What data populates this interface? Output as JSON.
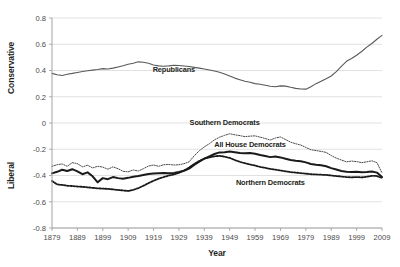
{
  "chart_data": {
    "type": "line",
    "title": "",
    "xlabel": "Year",
    "ylabel_top": "Conservative",
    "ylabel_bottom": "Liberal",
    "xlim": [
      1879,
      2009
    ],
    "ylim": [
      -0.8,
      0.8
    ],
    "ytick_labels": [
      "0.8",
      "0.6",
      "0.4",
      "0.2",
      "0",
      "-0.2",
      "-0.4",
      "-0.6",
      "-0.8"
    ],
    "ytick_values": [
      0.8,
      0.6,
      0.4,
      0.2,
      0,
      -0.2,
      -0.4,
      -0.6,
      -0.8
    ],
    "xtick_labels": [
      "1879",
      "1889",
      "1899",
      "1909",
      "1919",
      "1929",
      "1939",
      "1949",
      "1959",
      "1969",
      "1979",
      "1989",
      "1999",
      "2009"
    ],
    "xtick_values": [
      1879,
      1889,
      1899,
      1909,
      1919,
      1929,
      1939,
      1949,
      1959,
      1969,
      1979,
      1989,
      1999,
      2009
    ],
    "grid": true,
    "legend_position": "inline-annotations",
    "x": [
      1879,
      1881,
      1883,
      1885,
      1887,
      1889,
      1891,
      1893,
      1895,
      1897,
      1899,
      1901,
      1903,
      1905,
      1907,
      1909,
      1911,
      1913,
      1915,
      1917,
      1919,
      1921,
      1923,
      1925,
      1927,
      1929,
      1931,
      1933,
      1935,
      1937,
      1939,
      1941,
      1943,
      1945,
      1947,
      1949,
      1951,
      1953,
      1955,
      1957,
      1959,
      1961,
      1963,
      1965,
      1967,
      1969,
      1971,
      1973,
      1975,
      1977,
      1979,
      1981,
      1983,
      1985,
      1987,
      1989,
      1991,
      1993,
      1995,
      1997,
      1999,
      2001,
      2003,
      2005,
      2007,
      2009
    ],
    "series": [
      {
        "name": "Republicans",
        "style": "solid-thin",
        "color": "#595959",
        "width": 1.1,
        "values": [
          0.378,
          0.368,
          0.362,
          0.372,
          0.378,
          0.385,
          0.392,
          0.398,
          0.403,
          0.408,
          0.414,
          0.412,
          0.418,
          0.427,
          0.436,
          0.447,
          0.455,
          0.466,
          0.463,
          0.455,
          0.442,
          0.435,
          0.432,
          0.435,
          0.44,
          0.438,
          0.434,
          0.43,
          0.424,
          0.418,
          0.412,
          0.404,
          0.396,
          0.386,
          0.374,
          0.358,
          0.342,
          0.33,
          0.318,
          0.31,
          0.3,
          0.295,
          0.288,
          0.28,
          0.276,
          0.283,
          0.281,
          0.272,
          0.264,
          0.259,
          0.258,
          0.276,
          0.3,
          0.318,
          0.338,
          0.358,
          0.392,
          0.432,
          0.47,
          0.492,
          0.516,
          0.545,
          0.578,
          0.606,
          0.638,
          0.668
        ],
        "label_x": 1925,
        "label_text": "Republicans"
      },
      {
        "name": "Southern Democrats",
        "style": "dotted-thin",
        "color": "#4a4a4a",
        "width": 1.0,
        "values": [
          -0.33,
          -0.318,
          -0.312,
          -0.33,
          -0.302,
          -0.31,
          -0.334,
          -0.322,
          -0.342,
          -0.33,
          -0.336,
          -0.352,
          -0.334,
          -0.348,
          -0.368,
          -0.372,
          -0.358,
          -0.366,
          -0.348,
          -0.328,
          -0.32,
          -0.33,
          -0.318,
          -0.316,
          -0.32,
          -0.318,
          -0.31,
          -0.296,
          -0.25,
          -0.212,
          -0.182,
          -0.158,
          -0.128,
          -0.108,
          -0.094,
          -0.082,
          -0.09,
          -0.096,
          -0.104,
          -0.1,
          -0.098,
          -0.108,
          -0.118,
          -0.13,
          -0.114,
          -0.106,
          -0.126,
          -0.146,
          -0.158,
          -0.168,
          -0.186,
          -0.204,
          -0.21,
          -0.216,
          -0.224,
          -0.248,
          -0.268,
          -0.282,
          -0.296,
          -0.29,
          -0.294,
          -0.302,
          -0.296,
          -0.288,
          -0.302,
          -0.38
        ],
        "label_x": 1945,
        "label_text": "Southern Democrats"
      },
      {
        "name": "All House Democrats",
        "style": "solid-thick",
        "color": "#1a1a1a",
        "width": 2.0,
        "values": [
          -0.384,
          -0.372,
          -0.356,
          -0.366,
          -0.352,
          -0.368,
          -0.39,
          -0.376,
          -0.406,
          -0.452,
          -0.42,
          -0.428,
          -0.412,
          -0.42,
          -0.424,
          -0.418,
          -0.41,
          -0.404,
          -0.396,
          -0.388,
          -0.384,
          -0.382,
          -0.38,
          -0.382,
          -0.38,
          -0.374,
          -0.364,
          -0.348,
          -0.32,
          -0.294,
          -0.272,
          -0.254,
          -0.236,
          -0.224,
          -0.222,
          -0.218,
          -0.222,
          -0.228,
          -0.23,
          -0.228,
          -0.234,
          -0.244,
          -0.252,
          -0.26,
          -0.256,
          -0.262,
          -0.272,
          -0.282,
          -0.288,
          -0.292,
          -0.3,
          -0.312,
          -0.318,
          -0.322,
          -0.33,
          -0.344,
          -0.354,
          -0.366,
          -0.372,
          -0.374,
          -0.372,
          -0.376,
          -0.374,
          -0.37,
          -0.378,
          -0.412
        ],
        "label_x": 1955,
        "label_text": "All House Democrats"
      },
      {
        "name": "Northern Democrats",
        "style": "dotted-thick",
        "color": "#1a1a1a",
        "width": 1.8,
        "values": [
          -0.442,
          -0.468,
          -0.472,
          -0.478,
          -0.48,
          -0.484,
          -0.486,
          -0.49,
          -0.494,
          -0.498,
          -0.5,
          -0.502,
          -0.506,
          -0.51,
          -0.514,
          -0.518,
          -0.51,
          -0.496,
          -0.478,
          -0.458,
          -0.44,
          -0.424,
          -0.412,
          -0.4,
          -0.392,
          -0.38,
          -0.362,
          -0.34,
          -0.312,
          -0.29,
          -0.272,
          -0.262,
          -0.254,
          -0.25,
          -0.256,
          -0.266,
          -0.282,
          -0.296,
          -0.306,
          -0.316,
          -0.324,
          -0.334,
          -0.342,
          -0.35,
          -0.356,
          -0.362,
          -0.368,
          -0.374,
          -0.378,
          -0.382,
          -0.386,
          -0.39,
          -0.392,
          -0.394,
          -0.396,
          -0.4,
          -0.404,
          -0.408,
          -0.412,
          -0.414,
          -0.412,
          -0.414,
          -0.41,
          -0.402,
          -0.404,
          -0.418
        ],
        "label_x": 1963,
        "label_text": "Northern Democrats"
      }
    ],
    "annotations": [
      {
        "text": "Republicans",
        "x": 1927,
        "y": 0.385
      },
      {
        "text": "Southern Democrats",
        "x": 1947,
        "y": -0.018
      },
      {
        "text": "All House Democrats",
        "x": 1957,
        "y": -0.182
      },
      {
        "text": "Northern Democrats",
        "x": 1965,
        "y": -0.47
      }
    ]
  }
}
